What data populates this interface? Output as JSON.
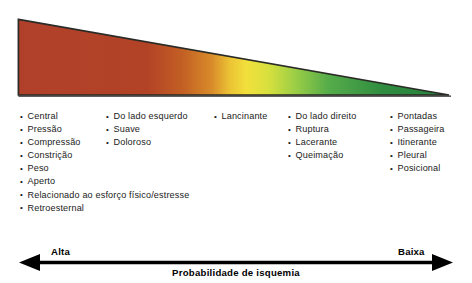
{
  "figure": {
    "wedge": {
      "description": "gradient-wedge-high-to-low-ischemia-probability",
      "gradient_stops": [
        {
          "offset": "0%",
          "color": "#b0402a"
        },
        {
          "offset": "30%",
          "color": "#b34326"
        },
        {
          "offset": "38%",
          "color": "#c25f24"
        },
        {
          "offset": "45%",
          "color": "#d98c2a"
        },
        {
          "offset": "49%",
          "color": "#ebc234"
        },
        {
          "offset": "53%",
          "color": "#f2e03c"
        },
        {
          "offset": "58%",
          "color": "#d8e03e"
        },
        {
          "offset": "64%",
          "color": "#9ecf45"
        },
        {
          "offset": "72%",
          "color": "#55ac4a"
        },
        {
          "offset": "85%",
          "color": "#2f8c40"
        },
        {
          "offset": "100%",
          "color": "#27803c"
        }
      ],
      "outline_color": "#2a2a26"
    },
    "columns": [
      {
        "name": "column-1-typical-ischemic-descriptors",
        "items": [
          "Central",
          "Pressão",
          "Compressão",
          "Constrição",
          "Peso",
          "Aperto",
          "Relacionado ao esforço físico/estresse",
          "Retroesternal"
        ]
      },
      {
        "name": "column-2",
        "items": [
          "Do lado esquerdo",
          "Suave",
          "Doloroso"
        ]
      },
      {
        "name": "column-3",
        "items": [
          "Lancinante"
        ]
      },
      {
        "name": "column-4",
        "items": [
          "Do lado direito",
          "Ruptura",
          "Lacerante",
          "Queimação"
        ]
      },
      {
        "name": "column-5-atypical-descriptors",
        "items": [
          "Pontadas",
          "Passageira",
          "Itinerante",
          "Pleural",
          "Posicional"
        ]
      }
    ],
    "axis": {
      "left_label": "Alta",
      "right_label": "Baixa",
      "title": "Probabilidade de isquemia",
      "line_color": "#000000"
    }
  }
}
